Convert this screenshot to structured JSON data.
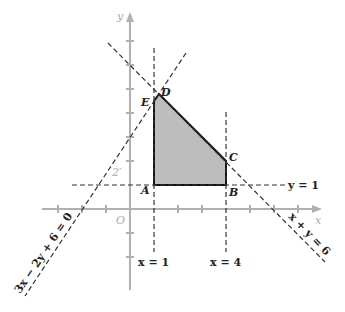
{
  "diagram": {
    "type": "linear-programming-feasible-region",
    "axes": {
      "x_label": "x",
      "y_label": "y",
      "origin_label": "O",
      "axis_color": "#b0b0b0"
    },
    "lines": {
      "x_eq_1": "x = 1",
      "x_eq_4": "x = 4",
      "y_eq_1": "y = 1",
      "x_plus_y": "x + y = 6",
      "three_x": "3x − 2y + 6 = 0"
    },
    "vertices": {
      "A": "A",
      "B": "B",
      "C": "C",
      "D": "D",
      "E": "E"
    },
    "faint_label": "2′",
    "region_fill": "#bdbdbd",
    "region_stroke": "#111111"
  }
}
